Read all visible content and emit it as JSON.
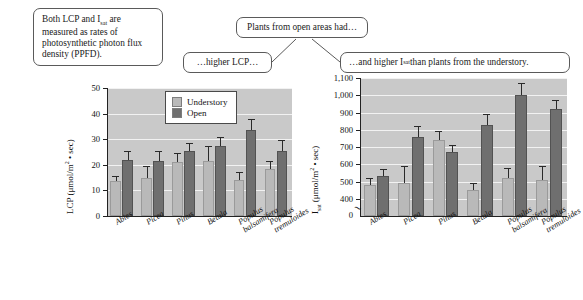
{
  "annotations": {
    "ppfd_note": "Both LCP and I",
    "ppfd_note_sub": "sat",
    "ppfd_note_rest": " are measured as rates of photosynthetic photon flux density (PPFD).",
    "open_areas": "Plants from open areas had…",
    "higher_lcp": "…higher LCP…",
    "higher_isat_pre": "…and higher I",
    "higher_isat_sub": "sat",
    "higher_isat_post": " than plants from the understory."
  },
  "legend": {
    "understory_label": "Understory",
    "open_label": "Open",
    "understory_color": "#b9b9b9",
    "open_color": "#6f6f6f"
  },
  "chart_data": [
    {
      "type": "bar",
      "id": "lcp",
      "title": "",
      "ylabel": "LCP (μmol/m² • sec)",
      "ylabel_main": "LCP (",
      "ylabel_unit": "μmol/m",
      "ylabel_exp": "2",
      "ylabel_tail": " • sec)",
      "xlabel": "",
      "ylim": [
        0,
        50
      ],
      "yticks": [
        0,
        10,
        20,
        30,
        40,
        50
      ],
      "yticklabels": [
        "0",
        "10",
        "20",
        "30",
        "40",
        "50"
      ],
      "grid": true,
      "axis_broken": false,
      "categories": [
        "Abies",
        "Picea",
        "Pinus",
        "Betula",
        "Populus balsamifera",
        "Populus tremuloides"
      ],
      "category_lines": [
        [
          "Abies"
        ],
        [
          "Picea"
        ],
        [
          "Pinus"
        ],
        [
          "Betula"
        ],
        [
          "Populus",
          "balsamifera"
        ],
        [
          "Populus",
          "tremuloides"
        ]
      ],
      "series": [
        {
          "name": "Understory",
          "values": [
            13.5,
            15.0,
            21.0,
            21.5,
            14.0,
            18.5
          ],
          "errors": [
            2.0,
            4.5,
            3.5,
            6.0,
            3.0,
            3.0
          ]
        },
        {
          "name": "Open",
          "values": [
            22.0,
            21.5,
            25.5,
            27.5,
            33.5,
            25.5
          ],
          "errors": [
            3.5,
            4.0,
            3.0,
            3.5,
            4.5,
            4.0
          ]
        }
      ]
    },
    {
      "type": "bar",
      "id": "isat",
      "title": "",
      "ylabel": "Isat (μmol/m² • sec)",
      "ylabel_main": "I",
      "ylabel_sub": "sat",
      "ylabel_unit": " (μmol/m",
      "ylabel_exp": "2",
      "ylabel_tail": " • sec)",
      "xlabel": "",
      "ylim": [
        300,
        1100
      ],
      "yticks": [
        400,
        500,
        600,
        700,
        800,
        900,
        1000,
        1100
      ],
      "yticklabels": [
        "400",
        "500",
        "600",
        "700",
        "800",
        "900",
        "1,000",
        "1,100"
      ],
      "zero_label": "0",
      "grid": true,
      "axis_broken": true,
      "categories": [
        "Abies",
        "Picea",
        "Pinus",
        "Betula",
        "Populus balsamifera",
        "Populus tremuloides"
      ],
      "category_lines": [
        [
          "Abies"
        ],
        [
          "Picea"
        ],
        [
          "Pinus"
        ],
        [
          "Betula"
        ],
        [
          "Populus",
          "balsamifera"
        ],
        [
          "Populus",
          "tremuloides"
        ]
      ],
      "series": [
        {
          "name": "Understory",
          "values": [
            480,
            490,
            740,
            450,
            520,
            510
          ],
          "errors": [
            40,
            100,
            50,
            40,
            60,
            80
          ]
        },
        {
          "name": "Open",
          "values": [
            530,
            760,
            670,
            830,
            1000,
            920
          ],
          "errors": [
            40,
            60,
            40,
            60,
            70,
            50
          ]
        }
      ]
    }
  ]
}
